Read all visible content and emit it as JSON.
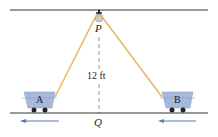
{
  "diagram": {
    "labels": {
      "pulley": "P",
      "ground_point": "Q",
      "height": "12 ft",
      "cart_a": "A",
      "cart_b": "B"
    },
    "colors": {
      "rope": "#e8b860",
      "cart": "#a6b9dc",
      "arrow": "#5a78c8",
      "dashed": "#7a95c4",
      "line": "#333333"
    }
  }
}
